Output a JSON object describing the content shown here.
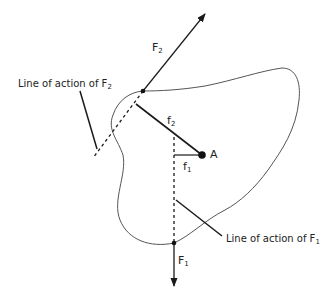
{
  "diagram": {
    "colors": {
      "ink": "#1a1a1a",
      "outline": "#555555",
      "background": "#ffffff"
    },
    "body_outline": "irregular closed body shape",
    "point_A": {
      "label": "A"
    },
    "forces": [
      {
        "name": "F",
        "subscript": "2",
        "direction": "up-right"
      },
      {
        "name": "F",
        "subscript": "1",
        "direction": "down"
      }
    ],
    "moment_arms": [
      {
        "name": "f",
        "subscript": "2"
      },
      {
        "name": "f",
        "subscript": "1"
      }
    ],
    "callouts": {
      "line_of_action_F2": {
        "text": "Line of action of F",
        "subscript": "2"
      },
      "line_of_action_F1": {
        "text": "Line of action of F",
        "subscript": "1"
      }
    }
  }
}
